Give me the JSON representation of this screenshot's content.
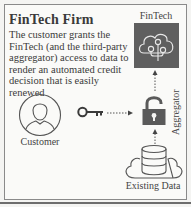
{
  "diagram": {
    "title": "FinTech Firm",
    "description": "The customer grants the FinTech (and the third-party aggregator) access to data to render an automated credit decision that is easily renewed",
    "nodes": {
      "fintech": {
        "label": "FinTech",
        "icon": "tree-cloud-icon",
        "fill": "#5f5f5f"
      },
      "customer": {
        "label": "Customer",
        "icon": "person-icon"
      },
      "key": {
        "icon": "key-icon"
      },
      "aggregator": {
        "label": "Aggregator",
        "icon": "lock-icon",
        "fill": "#5a5a5a"
      },
      "existing_data": {
        "label": "Existing Data",
        "icon": "database-cloud-icon"
      }
    },
    "edges": [
      {
        "from": "key",
        "to": "aggregator",
        "style": "dotted-arrow"
      },
      {
        "from": "aggregator",
        "to": "fintech",
        "style": "dotted-arrow"
      },
      {
        "from": "existing_data",
        "to": "aggregator",
        "style": "dotted-arrow"
      }
    ]
  }
}
